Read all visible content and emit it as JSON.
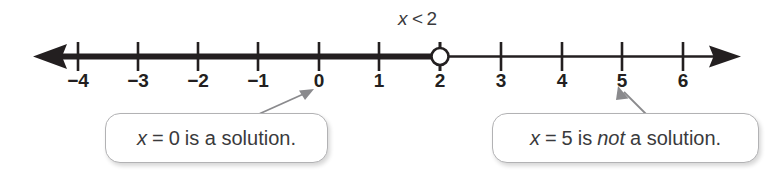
{
  "figure": {
    "type": "number-line-inequality",
    "background_color": "#ffffff",
    "line_color": "#231f20",
    "callout_border_color": "#b2b2b4",
    "text_color": "#3a3a3c"
  },
  "inequality": {
    "variable": "x",
    "relation": "<",
    "value": "2",
    "full_text": "x < 2"
  },
  "number_line": {
    "min_tick": -4,
    "max_tick": 6,
    "tick_labels": [
      "−4",
      "−3",
      "−2",
      "−1",
      "0",
      "1",
      "2",
      "3",
      "4",
      "5",
      "6"
    ],
    "tick_values": [
      -4,
      -3,
      -2,
      -1,
      0,
      1,
      2,
      3,
      4,
      5,
      6
    ],
    "left_arrow": "arrow-left-icon",
    "right_arrow": "arrow-right-icon",
    "endpoint": {
      "value": 2,
      "style": "open-circle",
      "included": false
    },
    "shaded_direction": "left",
    "shaded_from": "-infinity",
    "shaded_to": 2
  },
  "callouts": [
    {
      "id": "callout-zero",
      "points_to_value": 0,
      "pointer": "arrow-up-right-icon",
      "parts": {
        "variable": "x",
        "equals": "=",
        "value": "0",
        "tail": "is a solution."
      },
      "full_text": "x = 0 is a solution."
    },
    {
      "id": "callout-five",
      "points_to_value": 5,
      "pointer": "arrow-up-left-icon",
      "parts": {
        "variable": "x",
        "equals": "=",
        "value": "5",
        "is": "is",
        "emphasis": "not",
        "tail": "a solution."
      },
      "full_text": "x = 5 is not a solution."
    }
  ]
}
